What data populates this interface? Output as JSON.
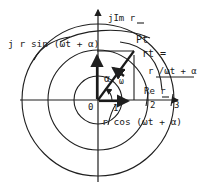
{
  "figure": {
    "axes": {
      "imag_label": "jIm r",
      "real_label": "Re r",
      "origin_label": "0",
      "ticks": [
        "1",
        "2",
        "3"
      ]
    },
    "labels": {
      "vertical_component": "j r sin (ωt + α)",
      "horizontal_component": "r cos (ωt + α)",
      "point": "Pt",
      "phasor_name": "rt =",
      "phasor_polar": "r /ωt + α",
      "radius": "r",
      "angle": "α",
      "angular_velocity": "ω"
    },
    "colors": {
      "ink": "#1f1f1f",
      "background": "#ffffff"
    },
    "circles": [
      {
        "radius_units": 1
      },
      {
        "radius_units": 2
      },
      {
        "radius_units": 3
      }
    ]
  }
}
